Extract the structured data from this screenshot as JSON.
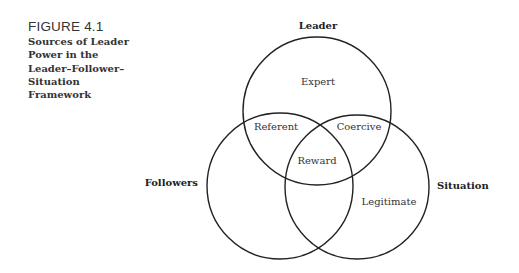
{
  "figure": {
    "number": "FIGURE 4.1",
    "title_lines": [
      "Sources of Leader",
      "Power in the",
      "Leader–Follower–",
      "Situation",
      "Framework"
    ]
  },
  "diagram": {
    "circles": [
      {
        "name": "Leader",
        "label": "Leader"
      },
      {
        "name": "Followers",
        "label": "Followers"
      },
      {
        "name": "Situation",
        "label": "Situation"
      }
    ],
    "regions": {
      "leader_only": "Expert",
      "leader_followers": "Referent",
      "leader_situation": "Coercive",
      "all_three": "Reward",
      "situation_only": "Legitimate"
    }
  }
}
